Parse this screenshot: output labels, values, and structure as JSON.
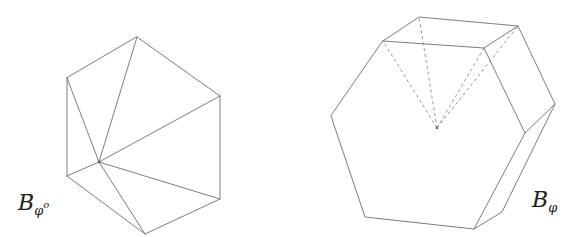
{
  "figures": [
    {
      "id": "left",
      "label_main": "B",
      "label_sub": "φ",
      "label_sup": "o",
      "description": "hexagon triangulated from interior point"
    },
    {
      "id": "right",
      "label_main": "B",
      "label_sub": "φ",
      "description": "3D hexagonal solid with dashed hidden edges to interior point"
    }
  ],
  "colors": {
    "edge": "#6e6e6e",
    "hidden": "#8a8a8a",
    "background": "#ffffff"
  }
}
